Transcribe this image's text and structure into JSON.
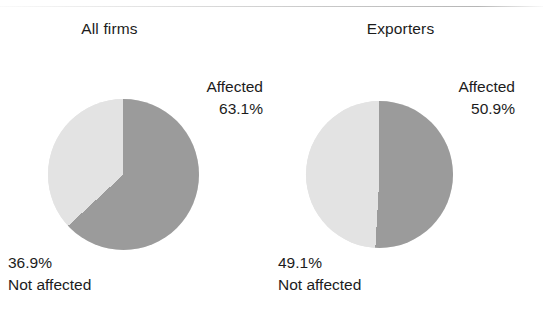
{
  "figure": {
    "background_color": "#ffffff",
    "rule_color": "#bcbcbc"
  },
  "chart_data": [
    {
      "type": "pie",
      "title": "All firms",
      "labels": [
        "Affected",
        "Not affected"
      ],
      "values": [
        63.1,
        36.9
      ],
      "value_labels": [
        "63.1%",
        "36.9%"
      ],
      "colors": [
        "#9b9b9b",
        "#e3e3e3"
      ],
      "start_angle_deg": 0,
      "direction": "clockwise",
      "legend": "none",
      "grid": false
    },
    {
      "type": "pie",
      "title": "Exporters",
      "labels": [
        "Affected",
        "Not affected"
      ],
      "values": [
        50.9,
        49.1
      ],
      "value_labels": [
        "50.9%",
        "49.1%"
      ],
      "colors": [
        "#9b9b9b",
        "#e3e3e3"
      ],
      "start_angle_deg": 0,
      "direction": "clockwise",
      "legend": "none",
      "grid": false
    }
  ],
  "panels": [
    {
      "title": "All firms",
      "affected_label": "Affected",
      "affected_value": "63.1%",
      "not_affected_value": "36.9%",
      "not_affected_label": "Not affected"
    },
    {
      "title": "Exporters",
      "affected_label": "Affected",
      "affected_value": "50.9%",
      "not_affected_value": "49.1%",
      "not_affected_label": "Not affected"
    }
  ]
}
